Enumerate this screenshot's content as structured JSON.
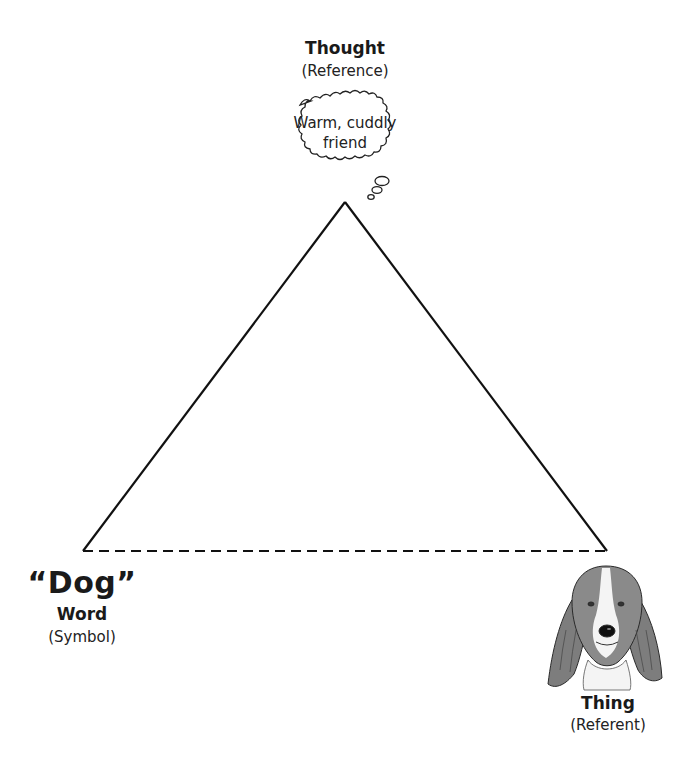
{
  "diagram": {
    "type": "semiotic-triangle",
    "thought": {
      "title": "Thought",
      "subtitle": "(Reference)",
      "bubble_text_line1": "Warm, cuddly",
      "bubble_text_line2": "friend"
    },
    "symbol": {
      "word": "“Dog”",
      "title": "Word",
      "subtitle": "(Symbol)"
    },
    "referent": {
      "title": "Thing",
      "subtitle": "(Referent)",
      "image": "basset-hound-head-icon"
    },
    "edges": [
      {
        "from": "symbol",
        "to": "thought",
        "style": "solid"
      },
      {
        "from": "thought",
        "to": "referent",
        "style": "solid"
      },
      {
        "from": "symbol",
        "to": "referent",
        "style": "dashed"
      }
    ],
    "colors": {
      "line": "#111111",
      "dog_fur": "#7a7a7a",
      "background": "#ffffff"
    }
  }
}
